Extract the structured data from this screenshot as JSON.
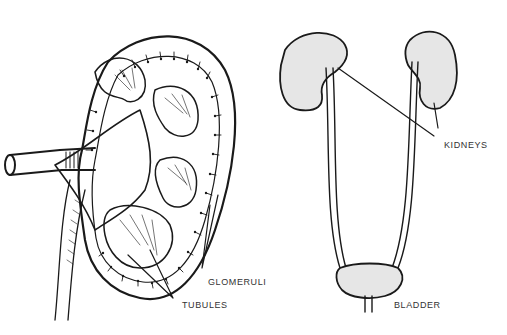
{
  "diagram": {
    "colors": {
      "ink": "#1a1a1a",
      "label": "#333333",
      "background": "#ffffff"
    },
    "left_panel": {
      "subject": "kidney-cross-section"
    },
    "right_panel": {
      "subject": "urinary-system"
    },
    "labels": {
      "glomeruli": "GLOMERULI",
      "tubules": "TUBULES",
      "kidneys": "KIDNEYS",
      "bladder": "BLADDER"
    }
  }
}
